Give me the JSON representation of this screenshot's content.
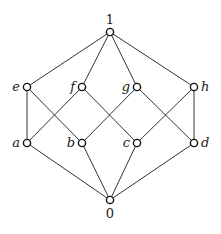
{
  "diagram": {
    "type": "hasse-diagram",
    "nodes": [
      {
        "id": "1",
        "label": "1",
        "x": 110,
        "y": 32,
        "label_pos": "top"
      },
      {
        "id": "e",
        "label": "e",
        "x": 27,
        "y": 87,
        "label_pos": "left"
      },
      {
        "id": "f",
        "label": "f",
        "x": 82,
        "y": 87,
        "label_pos": "left"
      },
      {
        "id": "g",
        "label": "g",
        "x": 137,
        "y": 87,
        "label_pos": "left"
      },
      {
        "id": "h",
        "label": "h",
        "x": 194,
        "y": 87,
        "label_pos": "right"
      },
      {
        "id": "a",
        "label": "a",
        "x": 27,
        "y": 143,
        "label_pos": "left"
      },
      {
        "id": "b",
        "label": "b",
        "x": 82,
        "y": 143,
        "label_pos": "left"
      },
      {
        "id": "c",
        "label": "c",
        "x": 137,
        "y": 143,
        "label_pos": "left"
      },
      {
        "id": "d",
        "label": "d",
        "x": 194,
        "y": 143,
        "label_pos": "right"
      },
      {
        "id": "0",
        "label": "0",
        "x": 110,
        "y": 200,
        "label_pos": "bottom"
      }
    ],
    "edges": [
      [
        "1",
        "e"
      ],
      [
        "1",
        "f"
      ],
      [
        "1",
        "g"
      ],
      [
        "1",
        "h"
      ],
      [
        "e",
        "a"
      ],
      [
        "e",
        "b"
      ],
      [
        "f",
        "a"
      ],
      [
        "f",
        "c"
      ],
      [
        "g",
        "b"
      ],
      [
        "g",
        "d"
      ],
      [
        "h",
        "c"
      ],
      [
        "h",
        "d"
      ],
      [
        "a",
        "0"
      ],
      [
        "b",
        "0"
      ],
      [
        "c",
        "0"
      ],
      [
        "d",
        "0"
      ]
    ]
  }
}
